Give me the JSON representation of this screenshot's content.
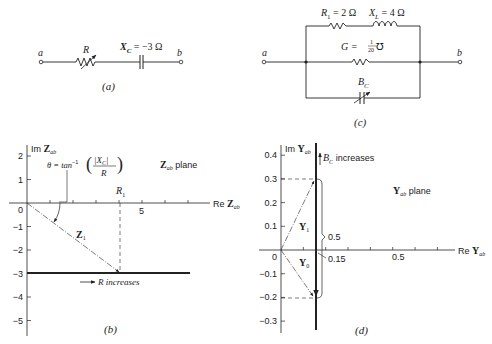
{
  "panel_a": {
    "label": "(a)",
    "node_a": "a",
    "node_b": "b",
    "resistor_label": "R",
    "capacitor_label": "X",
    "capacitor_sub": "C",
    "capacitor_value": " = −3 Ω"
  },
  "panel_c": {
    "label": "(c)",
    "node_a": "a",
    "node_b": "b",
    "r1_label": "R",
    "r1_sub": "1",
    "r1_value": " = 2 Ω",
    "xl_label": "X",
    "xl_sub": "L",
    "xl_value": " = 4 Ω",
    "g_label": "G = ",
    "g_num": "1",
    "g_den": "20",
    "g_unit": " ℧",
    "bc_label": "B",
    "bc_sub": "C"
  },
  "panel_b": {
    "label": "(b)",
    "y_axis_label": "Im ",
    "y_axis_var": "Z",
    "y_axis_sub": "ab",
    "x_axis_label": "Re ",
    "x_axis_var": "Z",
    "x_axis_sub": "ab",
    "plane_var": "Z",
    "plane_sub": "ab",
    "plane_text": " plane",
    "theta_text": "θ = tan",
    "theta_sup": "−1",
    "theta_num": "|X",
    "theta_num_sub": "C",
    "theta_num_end": "|",
    "theta_den": "R",
    "r1_label": "R",
    "r1_sub": "1",
    "z1_label": "Z",
    "z1_sub": "1",
    "arrow_text": "R increases",
    "origin_label": "0",
    "x_tick_label": "5",
    "y_ticks": [
      "2",
      "1",
      "−1",
      "−2",
      "−3",
      "−4",
      "−5"
    ]
  },
  "panel_d": {
    "label": "(d)",
    "y_axis_label": "Im ",
    "y_axis_var": "Y",
    "y_axis_sub": "ab",
    "x_axis_label": "Re ",
    "x_axis_var": "Y",
    "x_axis_sub": "ab",
    "plane_var": "Y",
    "plane_sub": "ab",
    "plane_text": " plane",
    "bc_label": "B",
    "bc_sub": "C",
    "bc_text": " increases",
    "y1_label": "Y",
    "y1_sub": "1",
    "y0_label": "Y",
    "y0_sub": "0",
    "span_label": "0.5",
    "g_label": "0.15",
    "x_tick_label": "0.5",
    "origin_label": "0",
    "y_ticks": [
      "0.4",
      "0.3",
      "0.2",
      "0.1",
      "−0.1",
      "−0.2",
      "−0.3"
    ]
  },
  "chart_data": [
    {
      "type": "line",
      "title": "Z_ab plane",
      "xlabel": "Re Z_ab",
      "ylabel": "Im Z_ab",
      "xlim": [
        0,
        10
      ],
      "ylim": [
        -5.5,
        2.5
      ],
      "locus": {
        "description": "R increases",
        "y": -3,
        "x_range": [
          0,
          10
        ]
      },
      "vectors": [
        {
          "name": "Z_1",
          "from": [
            0,
            0
          ],
          "to": [
            4,
            -3
          ]
        }
      ],
      "markers": [
        {
          "name": "R_1",
          "x": 4
        }
      ],
      "x_ticks": [
        5
      ],
      "y_ticks": [
        2,
        1,
        0,
        -1,
        -2,
        -3,
        -4,
        -5
      ]
    },
    {
      "type": "line",
      "title": "Y_ab plane",
      "xlabel": "Re Y_ab",
      "ylabel": "Im Y_ab",
      "xlim": [
        0,
        0.9
      ],
      "ylim": [
        -0.35,
        0.45
      ],
      "locus": {
        "description": "B_C increases",
        "x": 0.05
      },
      "vectors": [
        {
          "name": "Y_1",
          "from": [
            0,
            0
          ],
          "to": [
            0.05,
            0.3
          ]
        },
        {
          "name": "Y_0",
          "from": [
            0,
            0
          ],
          "to": [
            0.05,
            -0.2
          ]
        }
      ],
      "annotations": [
        {
          "text": "0.5",
          "meaning": "span from -0.2 to 0.3"
        },
        {
          "text": "0.15"
        }
      ],
      "x_ticks": [
        0.5
      ],
      "y_ticks": [
        0.4,
        0.3,
        0.2,
        0.1,
        0,
        -0.1,
        -0.2,
        -0.3
      ]
    }
  ]
}
